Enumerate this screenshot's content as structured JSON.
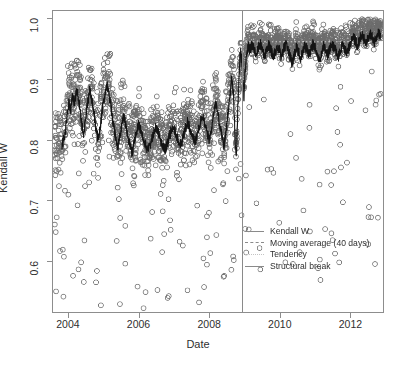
{
  "chart_data": {
    "type": "scatter",
    "title": "",
    "xlabel": "Date",
    "ylabel": "Kendall W",
    "xlim": [
      2003.55,
      2012.95
    ],
    "ylim": [
      0.515,
      1.013
    ],
    "xticks": [
      2004,
      2006,
      2008,
      2010,
      2012
    ],
    "xtick_labels": [
      "2004",
      "2006",
      "2008",
      "2010",
      "2012"
    ],
    "yticks": [
      0.6,
      0.7,
      0.8,
      0.9,
      1.0
    ],
    "ytick_labels": [
      "0.6",
      "0.7",
      "0.8",
      "0.9",
      "1.0"
    ],
    "grid": false,
    "legend_position": "center-right",
    "point_style": "open-circle",
    "point_color": "#6f6f6f",
    "point_radius_px": 2.4,
    "n_points": 2300,
    "series": [
      {
        "name": "Kendall W",
        "style": "scatter-open-circle",
        "color": "#6f6f6f",
        "description": "Daily Kendall W concordance values, 2003.7-2012.9. Pre-break cloud centred near 0.84 with spread 0.72-0.99 and sparse low outliers to 0.53; post-break cloud tightens near 0.96-1.00."
      },
      {
        "name": "Moving average (40 days)",
        "style": "solid-dark-line",
        "color": "#1a1a1a",
        "description": "40-day moving average of Kendall W, drawn as dark jagged line.",
        "points": [
          [
            2003.8,
            0.79
          ],
          [
            2003.88,
            0.805
          ],
          [
            2003.95,
            0.838
          ],
          [
            2004.0,
            0.862
          ],
          [
            2004.05,
            0.848
          ],
          [
            2004.1,
            0.872
          ],
          [
            2004.16,
            0.858
          ],
          [
            2004.22,
            0.884
          ],
          [
            2004.28,
            0.868
          ],
          [
            2004.33,
            0.846
          ],
          [
            2004.38,
            0.822
          ],
          [
            2004.43,
            0.806
          ],
          [
            2004.48,
            0.832
          ],
          [
            2004.54,
            0.862
          ],
          [
            2004.6,
            0.884
          ],
          [
            2004.66,
            0.866
          ],
          [
            2004.72,
            0.842
          ],
          [
            2004.78,
            0.818
          ],
          [
            2004.84,
            0.8
          ],
          [
            2004.9,
            0.824
          ],
          [
            2004.96,
            0.852
          ],
          [
            2005.02,
            0.874
          ],
          [
            2005.08,
            0.892
          ],
          [
            2005.14,
            0.878
          ],
          [
            2005.2,
            0.856
          ],
          [
            2005.26,
            0.83
          ],
          [
            2005.32,
            0.808
          ],
          [
            2005.38,
            0.786
          ],
          [
            2005.44,
            0.8
          ],
          [
            2005.5,
            0.822
          ],
          [
            2005.56,
            0.84
          ],
          [
            2005.62,
            0.826
          ],
          [
            2005.68,
            0.806
          ],
          [
            2005.74,
            0.79
          ],
          [
            2005.8,
            0.778
          ],
          [
            2005.86,
            0.794
          ],
          [
            2005.92,
            0.812
          ],
          [
            2005.98,
            0.826
          ],
          [
            2006.05,
            0.816
          ],
          [
            2006.12,
            0.802
          ],
          [
            2006.19,
            0.79
          ],
          [
            2006.26,
            0.782
          ],
          [
            2006.33,
            0.794
          ],
          [
            2006.4,
            0.808
          ],
          [
            2006.47,
            0.82
          ],
          [
            2006.54,
            0.812
          ],
          [
            2006.61,
            0.8
          ],
          [
            2006.68,
            0.79
          ],
          [
            2006.75,
            0.784
          ],
          [
            2006.82,
            0.796
          ],
          [
            2006.89,
            0.81
          ],
          [
            2006.96,
            0.822
          ],
          [
            2007.03,
            0.814
          ],
          [
            2007.1,
            0.802
          ],
          [
            2007.17,
            0.792
          ],
          [
            2007.24,
            0.8
          ],
          [
            2007.31,
            0.816
          ],
          [
            2007.38,
            0.83
          ],
          [
            2007.45,
            0.818
          ],
          [
            2007.52,
            0.804
          ],
          [
            2007.59,
            0.796
          ],
          [
            2007.66,
            0.808
          ],
          [
            2007.73,
            0.824
          ],
          [
            2007.8,
            0.842
          ],
          [
            2007.87,
            0.828
          ],
          [
            2007.94,
            0.812
          ],
          [
            2008.0,
            0.8
          ],
          [
            2008.06,
            0.818
          ],
          [
            2008.12,
            0.84
          ],
          [
            2008.18,
            0.862
          ],
          [
            2008.24,
            0.846
          ],
          [
            2008.3,
            0.824
          ],
          [
            2008.36,
            0.806
          ],
          [
            2008.42,
            0.79
          ],
          [
            2008.48,
            0.812
          ],
          [
            2008.54,
            0.848
          ],
          [
            2008.6,
            0.88
          ],
          [
            2008.64,
            0.904
          ],
          [
            2008.68,
            0.88
          ],
          [
            2008.71,
            0.846
          ],
          [
            2008.74,
            0.8
          ],
          [
            2008.77,
            0.77
          ],
          [
            2008.8,
            0.82
          ],
          [
            2008.83,
            0.88
          ],
          [
            2008.86,
            0.92
          ],
          [
            2008.89,
            0.944
          ],
          [
            2008.93,
            0.93
          ],
          [
            2008.96,
            0.9
          ],
          [
            2008.99,
            0.872
          ],
          [
            2009.02,
            0.908
          ],
          [
            2009.06,
            0.94
          ],
          [
            2009.1,
            0.956
          ],
          [
            2009.16,
            0.948
          ],
          [
            2009.22,
            0.958
          ],
          [
            2009.28,
            0.95
          ],
          [
            2009.34,
            0.94
          ],
          [
            2009.4,
            0.952
          ],
          [
            2009.46,
            0.958
          ],
          [
            2009.52,
            0.95
          ],
          [
            2009.58,
            0.938
          ],
          [
            2009.64,
            0.948
          ],
          [
            2009.7,
            0.956
          ],
          [
            2009.76,
            0.948
          ],
          [
            2009.82,
            0.936
          ],
          [
            2009.88,
            0.946
          ],
          [
            2009.94,
            0.954
          ],
          [
            2010.0,
            0.948
          ],
          [
            2010.06,
            0.936
          ],
          [
            2010.12,
            0.95
          ],
          [
            2010.18,
            0.958
          ],
          [
            2010.24,
            0.95
          ],
          [
            2010.3,
            0.938
          ],
          [
            2010.36,
            0.926
          ],
          [
            2010.42,
            0.94
          ],
          [
            2010.48,
            0.952
          ],
          [
            2010.54,
            0.946
          ],
          [
            2010.6,
            0.934
          ],
          [
            2010.66,
            0.946
          ],
          [
            2010.72,
            0.956
          ],
          [
            2010.78,
            0.95
          ],
          [
            2010.84,
            0.94
          ],
          [
            2010.9,
            0.95
          ],
          [
            2010.96,
            0.958
          ],
          [
            2011.02,
            0.952
          ],
          [
            2011.08,
            0.942
          ],
          [
            2011.14,
            0.93
          ],
          [
            2011.2,
            0.944
          ],
          [
            2011.26,
            0.956
          ],
          [
            2011.32,
            0.95
          ],
          [
            2011.38,
            0.94
          ],
          [
            2011.44,
            0.95
          ],
          [
            2011.5,
            0.958
          ],
          [
            2011.56,
            0.952
          ],
          [
            2011.62,
            0.944
          ],
          [
            2011.68,
            0.936
          ],
          [
            2011.74,
            0.948
          ],
          [
            2011.8,
            0.958
          ],
          [
            2011.86,
            0.952
          ],
          [
            2011.92,
            0.944
          ],
          [
            2011.98,
            0.952
          ],
          [
            2012.04,
            0.962
          ],
          [
            2012.1,
            0.97
          ],
          [
            2012.16,
            0.964
          ],
          [
            2012.22,
            0.956
          ],
          [
            2012.28,
            0.966
          ],
          [
            2012.34,
            0.974
          ],
          [
            2012.4,
            0.968
          ],
          [
            2012.46,
            0.96
          ],
          [
            2012.52,
            0.968
          ],
          [
            2012.58,
            0.976
          ],
          [
            2012.64,
            0.97
          ],
          [
            2012.7,
            0.962
          ],
          [
            2012.76,
            0.97
          ],
          [
            2012.82,
            0.976
          ],
          [
            2012.88,
            0.972
          ]
        ]
      },
      {
        "name": "Tendency",
        "style": "dotted-light-line",
        "color": "#c4c4c4",
        "description": "Flat tendency line over the post-break period near 0.962.",
        "points": [
          [
            2008.92,
            0.962
          ],
          [
            2012.9,
            0.962
          ]
        ]
      },
      {
        "name": "Structural break",
        "style": "vertical-line",
        "color": "#8a8a8a",
        "x": 2008.92,
        "description": "Vertical line marking the structural break near the end of 2008."
      }
    ]
  },
  "legend": {
    "items": [
      {
        "label": "Kendall W",
        "swatch": "solid"
      },
      {
        "label": "Moving average (40 days)",
        "swatch": "dashed"
      },
      {
        "label": "Tendency",
        "swatch": "dotted"
      },
      {
        "label": "Structural break",
        "swatch": "break"
      }
    ]
  }
}
